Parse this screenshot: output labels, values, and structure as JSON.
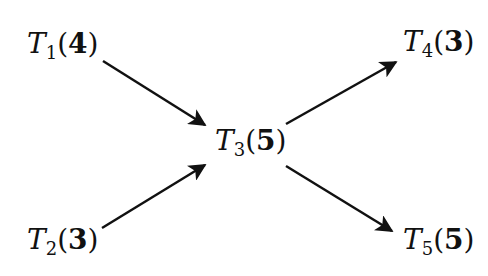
{
  "diagram": {
    "nodes": [
      {
        "id": "T1",
        "letter": "T",
        "sub": "1",
        "weight": "4"
      },
      {
        "id": "T2",
        "letter": "T",
        "sub": "2",
        "weight": "3"
      },
      {
        "id": "T3",
        "letter": "T",
        "sub": "3",
        "weight": "5"
      },
      {
        "id": "T4",
        "letter": "T",
        "sub": "4",
        "weight": "3"
      },
      {
        "id": "T5",
        "letter": "T",
        "sub": "5",
        "weight": "5"
      }
    ],
    "edges": [
      {
        "from": "T1",
        "to": "T3"
      },
      {
        "from": "T2",
        "to": "T3"
      },
      {
        "from": "T3",
        "to": "T4"
      },
      {
        "from": "T3",
        "to": "T5"
      }
    ],
    "colors": {
      "stroke": "#111111",
      "background": "#ffffff"
    }
  }
}
